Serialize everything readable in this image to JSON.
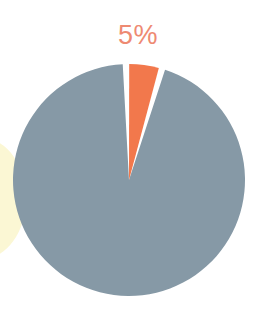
{
  "figure": {
    "width": 273,
    "height": 332,
    "background_color": "#ffffff"
  },
  "chart_data": {
    "type": "pie",
    "title": "",
    "subtitle": "",
    "xlabel": "",
    "ylabel": "",
    "grid": false,
    "legend": false,
    "legend_position": "none",
    "labels": [
      "Highlighted segment",
      "Remainder"
    ],
    "values": [
      5,
      95
    ],
    "units": "percent",
    "data_labels": [
      "5%",
      ""
    ],
    "visible_data_labels": [
      "5%"
    ],
    "colors": [
      "#f2784c",
      "#8699a6"
    ],
    "slice_gap_color": "#ffffff",
    "start_angle_deg": 0,
    "direction": "clockwise",
    "annotations": [
      {
        "text": "5%",
        "color": "#ee8a72",
        "font_size_px": 27,
        "x": 141,
        "y": 36,
        "attached_to_slice": 0
      }
    ],
    "geometry": {
      "center_x": 129,
      "center_y": 180,
      "radius": 116,
      "slice_0_start_deg": 358.5,
      "slice_0_end_deg": 16.5
    }
  },
  "decor": {
    "background_shape": {
      "name": "pale-yellow-backdrop",
      "color": "#fbf7d4",
      "x": -62,
      "y": 138,
      "width": 88,
      "height": 121
    }
  },
  "accent": {
    "slice_color": "#f2784c",
    "base_color": "#8699a6",
    "label_color": "#ee8a72",
    "backdrop_color": "#fbf7d4"
  }
}
